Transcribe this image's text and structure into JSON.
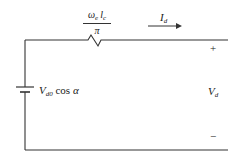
{
  "diagram": {
    "type": "equivalent-circuit",
    "resistor_label": {
      "numerator_symbol": "ω",
      "numerator_symbol_sub": "e",
      "numerator_var": "l",
      "numerator_var_sub": "c",
      "denominator": "π"
    },
    "current_label": {
      "symbol": "I",
      "sub": "d"
    },
    "source_label": {
      "symbol": "V",
      "sub": "d0",
      "func": "cos",
      "angle": "α"
    },
    "output_label": {
      "symbol": "V",
      "sub": "d"
    },
    "plus_sign": "+",
    "minus_sign": "−"
  }
}
